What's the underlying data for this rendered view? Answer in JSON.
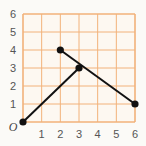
{
  "chart_data": {
    "type": "line",
    "title": "",
    "xlabel": "",
    "ylabel": "",
    "xlim": [
      0,
      6
    ],
    "ylim": [
      0,
      6
    ],
    "grid": true,
    "origin_label": "O",
    "x_ticks": [
      "1",
      "2",
      "3",
      "4",
      "5",
      "6"
    ],
    "y_ticks": [
      "1",
      "2",
      "3",
      "4",
      "5",
      "6"
    ],
    "series": [
      {
        "name": "segment-a",
        "points": [
          [
            0,
            0
          ],
          [
            3,
            3
          ]
        ]
      },
      {
        "name": "segment-b",
        "points": [
          [
            2,
            4
          ],
          [
            6,
            1
          ]
        ]
      }
    ],
    "colors": {
      "grid": "#f2b27a",
      "plot_background": "#fdf8f1",
      "line": "#111111",
      "label": "#555555"
    }
  }
}
